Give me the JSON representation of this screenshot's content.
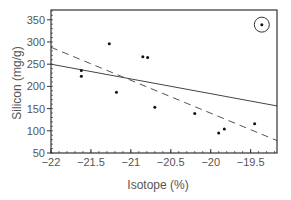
{
  "chart_data": {
    "type": "scatter",
    "title": "",
    "xlabel": "Isotope (%)",
    "ylabel": "Silicon (mg/g)",
    "xlim": [
      -22,
      -19.17
    ],
    "ylim": [
      50,
      372
    ],
    "xticks": [
      -22,
      -21.5,
      -21,
      -20.5,
      -20,
      -19.5
    ],
    "xtick_labels": [
      "−22",
      "−21.5",
      "−21",
      "−20.5",
      "−20",
      "−19.5"
    ],
    "yticks": [
      50,
      100,
      150,
      200,
      250,
      300,
      350
    ],
    "ytick_labels": [
      "50",
      "100",
      "150",
      "200",
      "250",
      "300",
      "350"
    ],
    "grid": false,
    "legend": null,
    "series": [
      {
        "name": "samples",
        "type": "scatter",
        "points": [
          {
            "x": -21.27,
            "y": 296
          },
          {
            "x": -20.85,
            "y": 267
          },
          {
            "x": -20.79,
            "y": 265
          },
          {
            "x": -21.62,
            "y": 236
          },
          {
            "x": -21.62,
            "y": 223
          },
          {
            "x": -21.18,
            "y": 187
          },
          {
            "x": -20.7,
            "y": 153
          },
          {
            "x": -20.2,
            "y": 139
          },
          {
            "x": -19.9,
            "y": 95
          },
          {
            "x": -19.83,
            "y": 104
          },
          {
            "x": -19.45,
            "y": 116
          },
          {
            "x": -19.36,
            "y": 339
          }
        ]
      },
      {
        "name": "regression (all points)",
        "type": "line",
        "style": "solid",
        "points": [
          {
            "x": -22,
            "y": 250
          },
          {
            "x": -19.17,
            "y": 156
          }
        ]
      },
      {
        "name": "regression (outlier excluded)",
        "type": "line",
        "style": "dashed",
        "points": [
          {
            "x": -22,
            "y": 288
          },
          {
            "x": -19.17,
            "y": 78
          }
        ]
      }
    ],
    "annotations": [
      {
        "type": "circle",
        "note": "outlier",
        "x": -19.36,
        "y": 339
      }
    ]
  },
  "colors": {
    "axis": "#333333",
    "points": "#111111",
    "solid_line": "#444444",
    "dashed_line": "#555555",
    "text": "#555555"
  }
}
